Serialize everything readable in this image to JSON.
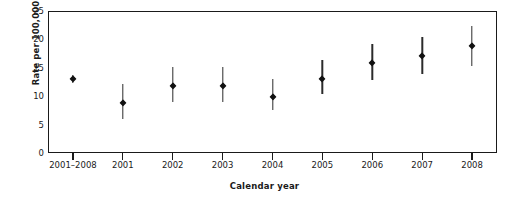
{
  "chart_data": {
    "type": "scatter",
    "title": "",
    "xlabel": "Calendar year",
    "ylabel": "Rate per 100,000",
    "categories": [
      "2001–2008",
      "2001",
      "2002",
      "2003",
      "2004",
      "2005",
      "2006",
      "2007",
      "2008"
    ],
    "values": [
      13.0,
      8.8,
      11.8,
      11.8,
      9.9,
      13.0,
      15.8,
      17.0,
      18.8
    ],
    "error_low": [
      12.3,
      6.0,
      8.9,
      8.9,
      7.5,
      10.3,
      12.8,
      13.9,
      15.3
    ],
    "error_high": [
      13.7,
      12.2,
      15.2,
      15.1,
      13.0,
      16.3,
      19.2,
      20.4,
      22.3
    ],
    "ylim": [
      0,
      25
    ],
    "ytick_labels": [
      "0",
      "5",
      "10",
      "15",
      "20",
      "25"
    ],
    "ytick_values": [
      0,
      5,
      10,
      15,
      20,
      25
    ],
    "grid": false,
    "legend": "none",
    "marker": "filled-diamond",
    "error_bar_style": "vertical-line",
    "series_name": "Rate per 100,000",
    "axis_color": "#1a1a1a",
    "marker_color": "#111111",
    "error_bar_color": "#2b2b2b",
    "background_color": "#ffffff"
  }
}
